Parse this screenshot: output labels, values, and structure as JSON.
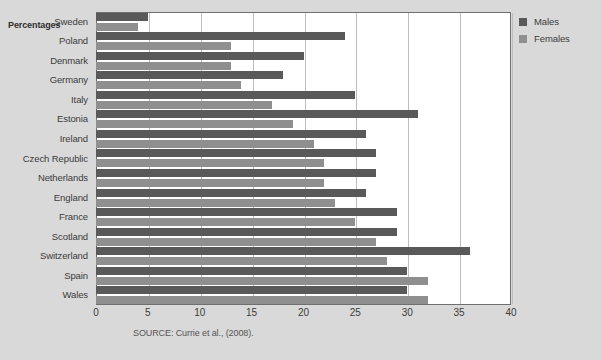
{
  "axis_title": "Percentages",
  "source_note": "SOURCE: Currie et al., (2008).",
  "legend": {
    "position": "top-right",
    "items": [
      {
        "label": "Males",
        "color": "#595959"
      },
      {
        "label": "Females",
        "color": "#8f8f8f"
      }
    ]
  },
  "chart_data": {
    "type": "bar",
    "orientation": "horizontal",
    "title": "",
    "subtitle": "",
    "xlabel": "Percentages",
    "ylabel": "",
    "xlim": [
      0,
      40
    ],
    "xticks": [
      0,
      5,
      10,
      15,
      20,
      25,
      30,
      35,
      40
    ],
    "grid": true,
    "categories": [
      "Sweden",
      "Poland",
      "Denmark",
      "Germany",
      "Italy",
      "Estonia",
      "Ireland",
      "Czech Republic",
      "Netherlands",
      "England",
      "France",
      "Scotland",
      "Switzerland",
      "Spain",
      "Wales"
    ],
    "series": [
      {
        "name": "Males",
        "color": "#595959",
        "values": [
          5,
          24,
          20,
          18,
          25,
          31,
          26,
          27,
          27,
          26,
          29,
          29,
          36,
          30,
          30
        ]
      },
      {
        "name": "Females",
        "color": "#8f8f8f",
        "values": [
          4,
          13,
          13,
          14,
          17,
          19,
          21,
          22,
          22,
          23,
          25,
          27,
          28,
          32,
          32
        ]
      }
    ],
    "annotations": [
      "SOURCE: Currie et al., (2008)."
    ]
  }
}
